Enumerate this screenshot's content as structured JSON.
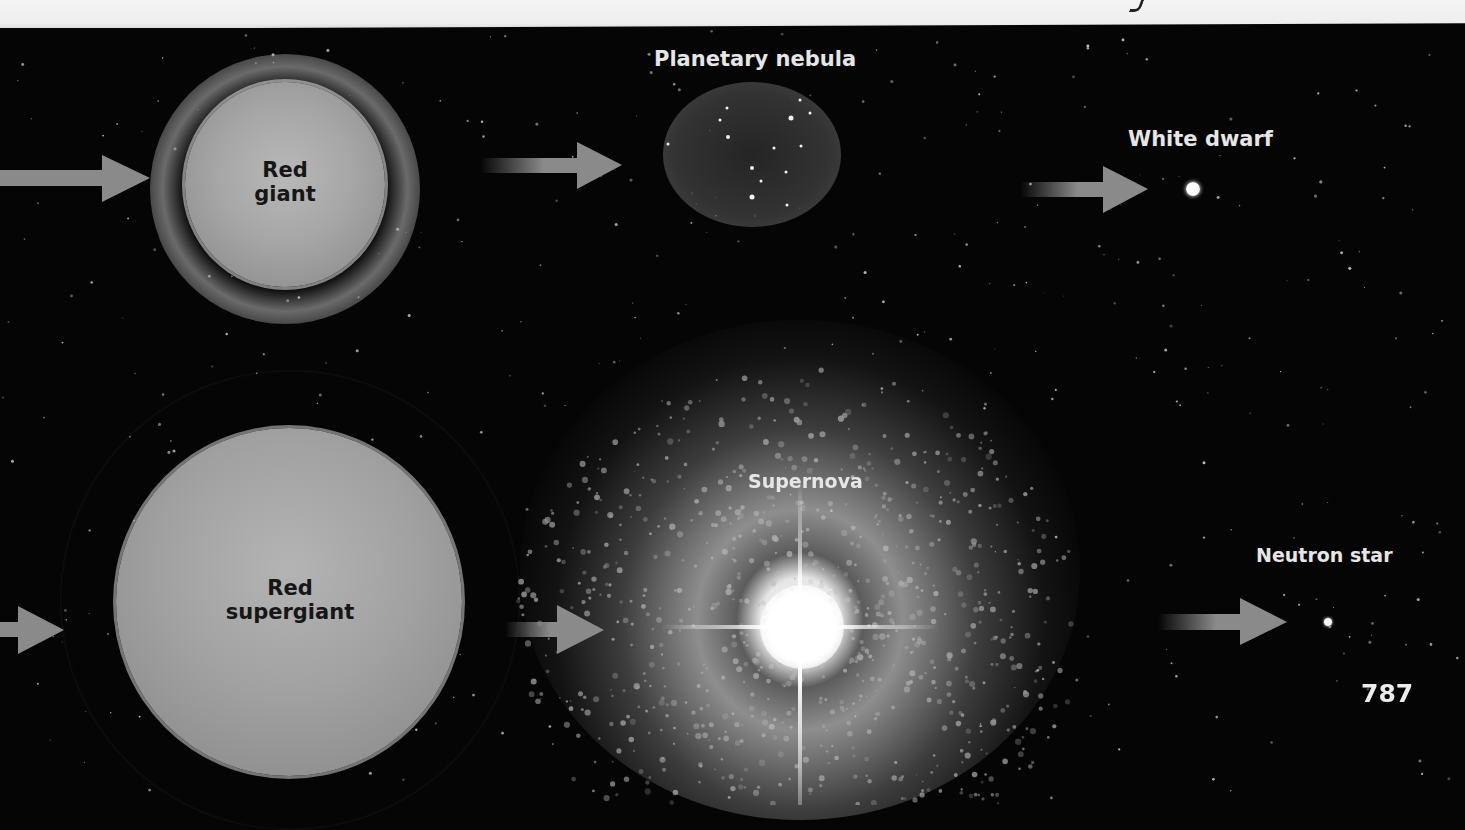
{
  "page": {
    "number": "787",
    "colors": {
      "background": "#050505",
      "page_edge": "#eeeeee",
      "arrow": "#8a8a8a",
      "label_light": "#e6e6e6",
      "label_dark": "#161616"
    }
  },
  "diagram": {
    "top_path": {
      "stages": [
        {
          "id": "red-giant",
          "label_line1": "Red",
          "label_line2": "giant"
        },
        {
          "id": "planetary-nebula",
          "label": "Planetary nebula"
        },
        {
          "id": "white-dwarf",
          "label": "White dwarf"
        }
      ]
    },
    "bottom_path": {
      "stages": [
        {
          "id": "red-supergiant",
          "label_line1": "Red",
          "label_line2": "supergiant"
        },
        {
          "id": "supernova",
          "label": "Supernova"
        },
        {
          "id": "neutron-star",
          "label": "Neutron star"
        }
      ]
    },
    "arrows": [
      {
        "from": "offscreen-left",
        "to": "red-giant"
      },
      {
        "from": "red-giant",
        "to": "planetary-nebula"
      },
      {
        "from": "planetary-nebula",
        "to": "white-dwarf"
      },
      {
        "from": "offscreen-left",
        "to": "red-supergiant"
      },
      {
        "from": "red-supergiant",
        "to": "supernova"
      },
      {
        "from": "supernova",
        "to": "neutron-star"
      }
    ]
  }
}
